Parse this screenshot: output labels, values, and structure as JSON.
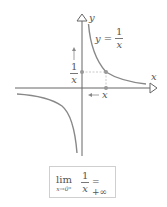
{
  "figure": {
    "function_label": {
      "lhs": "y",
      "equals": "=",
      "numerator": "1",
      "denominator": "x"
    },
    "axes": {
      "x_label": "x",
      "y_label": "y"
    },
    "point_labels": {
      "y_value": {
        "numerator": "1",
        "denominator": "x"
      },
      "x_value": "x"
    },
    "annotations": {
      "x_arrow": "left-arrow-toward-origin",
      "y_arrow": "up-arrow"
    },
    "limit_box": {
      "lim": "lim",
      "subscript": "x→0⁺",
      "numerator": "1",
      "denominator": "x",
      "result": "= +∞"
    },
    "colors": {
      "axis": "#666666",
      "curve": "#888888",
      "dashed": "#bbbbbb",
      "point": "#999999",
      "box_border": "#cfcfcf"
    }
  }
}
